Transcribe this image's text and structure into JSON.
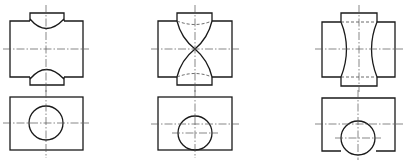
{
  "figure": {
    "type": "orthographic-projection-set",
    "colors": {
      "line": "#1a1a1a",
      "centerline": "#555555",
      "background": "#ffffff"
    },
    "views": [
      {
        "id": "set-1",
        "label": "",
        "top_view": "block with cylindrical notches top and bottom",
        "bottom_view": "rectangle with centered circle"
      },
      {
        "id": "set-2",
        "label": "",
        "top_view": "block with hourglass intersection curves",
        "bottom_view": "rectangle with circle tangent to bottom edge"
      },
      {
        "id": "set-3",
        "label": "",
        "top_view": "block with concave intersection curves",
        "bottom_view": "rectangle with circle extending past bottom edge"
      }
    ]
  }
}
